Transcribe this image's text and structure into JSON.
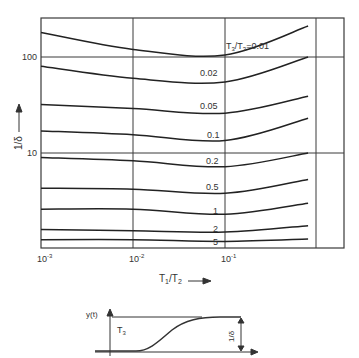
{
  "chart_data": {
    "type": "line",
    "title": "",
    "xlabel": "T1/T2",
    "ylabel": "1/δ",
    "xscale": "log",
    "yscale": "log",
    "xlim": [
      0.001,
      0.8
    ],
    "ylim": [
      1,
      250
    ],
    "grid": true,
    "x_ticks": [
      "10^-3",
      "10^-2",
      "10^-1"
    ],
    "y_ticks": [
      "10",
      "100"
    ],
    "legend_title": "T3/T3",
    "x": [
      0.001,
      0.01,
      0.1,
      0.8
    ],
    "series": [
      {
        "name": "0.01",
        "label": "T3/T3=0.01",
        "values": [
          180,
          120,
          105,
          210
        ]
      },
      {
        "name": "0.02",
        "label": "0.02",
        "values": [
          80,
          60,
          55,
          100
        ]
      },
      {
        "name": "0.05",
        "label": "0.05",
        "values": [
          32,
          29,
          26,
          39
        ]
      },
      {
        "name": "0.1",
        "label": "0.1",
        "values": [
          17,
          15.5,
          13.5,
          23
        ]
      },
      {
        "name": "0.2",
        "label": "0.2",
        "values": [
          9,
          8.3,
          7.2,
          10
        ]
      },
      {
        "name": "0.5",
        "label": "0.5",
        "values": [
          4.3,
          4.2,
          3.8,
          5.3
        ]
      },
      {
        "name": "1",
        "label": "1",
        "values": [
          2.6,
          2.6,
          2.3,
          3.0
        ]
      },
      {
        "name": "2",
        "label": "2",
        "values": [
          1.6,
          1.55,
          1.5,
          1.75
        ]
      },
      {
        "name": "5",
        "label": "5",
        "values": [
          1.25,
          1.25,
          1.2,
          1.27
        ]
      }
    ]
  },
  "axes": {
    "x_label_main": "T",
    "x_label_sub1": "1",
    "x_label_div": "/T",
    "x_label_sub2": "2",
    "y_label": "1/δ",
    "x_ticks": [
      {
        "base": "10",
        "exp": "-3"
      },
      {
        "base": "10",
        "exp": "-2"
      },
      {
        "base": "10",
        "exp": "-1"
      }
    ],
    "y_ticks": [
      "100",
      "10"
    ]
  },
  "curve_labels": [
    "0.02",
    "0.05",
    "0.1",
    "0.2",
    "0.5",
    "1",
    "2",
    "5"
  ],
  "first_curve_label": {
    "t": "T",
    "sub": "3",
    "div": "/T",
    "sub2": "3",
    "eq": "=0.01"
  },
  "inset": {
    "y_axis_label": "y(t)",
    "t3_label": "T",
    "t3_sub": "3",
    "delta_label": "1/δ"
  }
}
